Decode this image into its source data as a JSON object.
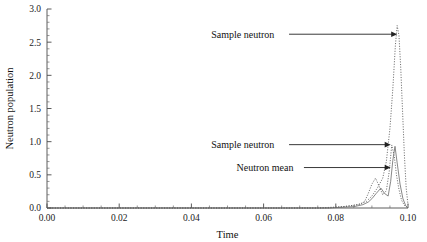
{
  "chart_data": {
    "type": "line",
    "title": "",
    "xlabel": "Time",
    "ylabel": "Neutron population",
    "xlim": [
      0.0,
      0.1
    ],
    "ylim": [
      0.0,
      3.0
    ],
    "xticks": [
      0.0,
      0.02,
      0.04,
      0.06,
      0.08,
      0.1
    ],
    "xtick_labels": [
      "0.00",
      "0.02",
      "0.04",
      "0.06",
      "0.08",
      "0.10"
    ],
    "yticks": [
      0.0,
      0.5,
      1.0,
      1.5,
      2.0,
      2.5,
      3.0
    ],
    "ytick_labels": [
      "0.0",
      "0.5",
      "1.0",
      "1.5",
      "2.0",
      "2.5",
      "3.0"
    ],
    "x_minor_step": 0.005,
    "y_minor_step": 0.1,
    "grid": false,
    "legend": "none",
    "series": [
      {
        "name": "Sample neutron 1",
        "style": "dotted",
        "color": "#555555",
        "x": [
          0.0,
          0.02,
          0.04,
          0.06,
          0.075,
          0.082,
          0.086,
          0.0885,
          0.09,
          0.0915,
          0.093,
          0.094,
          0.095,
          0.0958,
          0.0965,
          0.097,
          0.0975,
          0.098,
          0.0985,
          0.099,
          0.0995,
          0.1
        ],
        "y": [
          0.0,
          0.0,
          0.0,
          0.0,
          0.0,
          0.02,
          0.05,
          0.1,
          0.18,
          0.3,
          0.45,
          0.7,
          1.2,
          1.8,
          2.45,
          2.75,
          2.6,
          2.1,
          1.45,
          0.8,
          0.3,
          0.05
        ]
      },
      {
        "name": "Sample neutron 2",
        "style": "dotted",
        "color": "#666666",
        "x": [
          0.0,
          0.02,
          0.04,
          0.06,
          0.078,
          0.084,
          0.087,
          0.088,
          0.089,
          0.09,
          0.091,
          0.092,
          0.093,
          0.094,
          0.0948,
          0.0955,
          0.0962,
          0.0968,
          0.0975,
          0.0982,
          0.099,
          0.1
        ],
        "y": [
          0.0,
          0.0,
          0.0,
          0.0,
          0.0,
          0.03,
          0.06,
          0.1,
          0.22,
          0.36,
          0.45,
          0.33,
          0.2,
          0.26,
          0.55,
          0.95,
          0.78,
          0.5,
          0.28,
          0.12,
          0.04,
          0.0
        ]
      },
      {
        "name": "Neutron mean",
        "style": "solid",
        "color": "#6a6a6a",
        "x": [
          0.0,
          0.02,
          0.04,
          0.06,
          0.078,
          0.085,
          0.0875,
          0.089,
          0.09,
          0.0912,
          0.0925,
          0.0935,
          0.0945,
          0.0952,
          0.0958,
          0.0964,
          0.097,
          0.0978,
          0.0986,
          0.0994,
          0.1
        ],
        "y": [
          0.0,
          0.0,
          0.0,
          0.0,
          0.0,
          0.02,
          0.05,
          0.09,
          0.14,
          0.22,
          0.3,
          0.22,
          0.18,
          0.4,
          0.72,
          0.93,
          0.68,
          0.36,
          0.14,
          0.03,
          0.0
        ]
      }
    ],
    "annotations": [
      {
        "text": "Sample neutron",
        "target_x": 0.097,
        "target_y": 2.62,
        "label_x": 0.0455,
        "label_y": 2.62
      },
      {
        "text": "Sample neutron",
        "target_x": 0.0952,
        "target_y": 0.955,
        "label_x": 0.0455,
        "label_y": 0.955
      },
      {
        "text": "Neutron mean",
        "target_x": 0.0952,
        "target_y": 0.61,
        "label_x": 0.0525,
        "label_y": 0.61
      }
    ]
  }
}
